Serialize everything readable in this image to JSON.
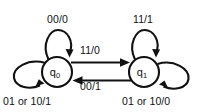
{
  "diagram": {
    "kind": "mealy-state-machine",
    "background_color": "#ffffff",
    "line_color": "#111111",
    "states": [
      {
        "id": "q0",
        "name": "q",
        "subscript": "0",
        "cx": 57,
        "cy": 72,
        "r": 15
      },
      {
        "id": "q1",
        "name": "q",
        "subscript": "1",
        "cx": 144,
        "cy": 72,
        "r": 15
      }
    ],
    "transitions": [
      {
        "id": "loop-q0",
        "from": "q0",
        "to": "q0",
        "label": "00/0",
        "placement": "top-left-self-loop"
      },
      {
        "id": "loop-q1",
        "from": "q1",
        "to": "q1",
        "label": "11/1",
        "placement": "top-right-self-loop"
      },
      {
        "id": "q0-to-q1",
        "from": "q0",
        "to": "q1",
        "label": "11/0",
        "placement": "upper-horizontal-rightward"
      },
      {
        "id": "q1-to-q0",
        "from": "q1",
        "to": "q0",
        "label": "00/1",
        "placement": "lower-horizontal-leftward"
      },
      {
        "id": "self-q0",
        "from": "q0",
        "to": "q0",
        "label": "01 or 10/1",
        "placement": "bottom-left-self-loop"
      },
      {
        "id": "self-q1",
        "from": "q1",
        "to": "q1",
        "label": "01 or 10/0",
        "placement": "bottom-right-self-loop"
      }
    ]
  }
}
